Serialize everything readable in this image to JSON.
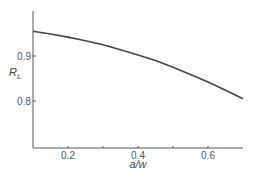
{
  "chart_data": {
    "type": "line",
    "title": "",
    "xlabel": "a/w",
    "ylabel": "R_L",
    "ylabel_main": "R",
    "ylabel_sub": "L",
    "xlim": [
      0.1,
      0.7
    ],
    "ylim": [
      0.72,
      1.0
    ],
    "x_ticks": [
      0.2,
      0.3,
      0.4,
      0.5,
      0.6
    ],
    "x_tick_labels": [
      "0.2",
      "",
      "0.4",
      "",
      "0.6"
    ],
    "y_ticks": [
      0.9,
      0.8
    ],
    "y_tick_labels": [
      "0.9",
      "0.8"
    ],
    "grid": false,
    "legend": null,
    "series": [
      {
        "name": "R_L",
        "x": [
          0.1,
          0.15,
          0.2,
          0.25,
          0.3,
          0.35,
          0.4,
          0.45,
          0.5,
          0.55,
          0.6,
          0.65,
          0.7
        ],
        "y": [
          0.955,
          0.949,
          0.942,
          0.934,
          0.925,
          0.914,
          0.902,
          0.89,
          0.875,
          0.859,
          0.842,
          0.824,
          0.805
        ]
      }
    ]
  }
}
